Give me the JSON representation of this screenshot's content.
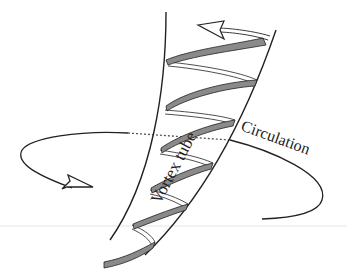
{
  "diagram": {
    "labels": {
      "vortex_tube": "Vortex tube",
      "circulation": "Circulation"
    },
    "colors": {
      "line": "#222222",
      "ribbon_fill": "#8a8a8a",
      "background": "#ffffff",
      "faint_rule": "#e4e4e4"
    },
    "elements": [
      {
        "name": "vortex-tube",
        "description": "Funnel-shaped tube widening upward"
      },
      {
        "name": "helical-ribbon",
        "description": "Spiral ribbon wrapping the tube, arrow at top pointing left"
      },
      {
        "name": "circulation-loop",
        "description": "Elliptical loop around tube with arrowhead on left pointing right"
      }
    ]
  }
}
